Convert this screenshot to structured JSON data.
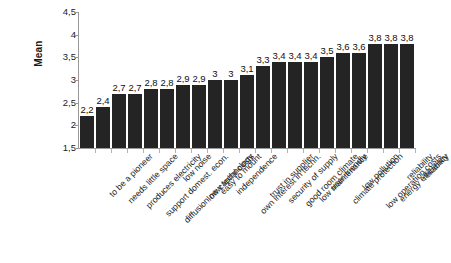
{
  "chart_data": {
    "type": "bar",
    "title": "",
    "subtitle": "",
    "xlabel": "",
    "ylabel": "Mean",
    "ylim": [
      1.5,
      4.5
    ],
    "ytick_labels": [
      "4,5",
      "4",
      "3,5",
      "3",
      "2,5",
      "2",
      "1,5"
    ],
    "ytick_values": [
      4.5,
      4.0,
      3.5,
      3.0,
      2.5,
      2.0,
      1.5
    ],
    "grid": false,
    "legend": "none",
    "decimal_separator": ",",
    "bar_color": "#242424",
    "categories": [
      "to be a pioneer",
      "needs little space",
      "produces electricity",
      "support domest. econ.",
      "diffusion new technology",
      "low noise",
      "low capital costs",
      "easy to mount",
      "independence",
      "own interest in techn.",
      "trust in supplier",
      "security of supply",
      "good room climate",
      "low maintenance",
      "user-friendly",
      "climate protection",
      "low pollution",
      "low operation costs",
      "energy efficiency",
      "reliability",
      "reliability"
    ],
    "values": [
      2.2,
      2.4,
      2.7,
      2.7,
      2.8,
      2.8,
      2.9,
      2.9,
      3.0,
      3.0,
      3.1,
      3.3,
      3.4,
      3.4,
      3.4,
      3.5,
      3.6,
      3.6,
      3.8,
      3.8,
      3.8
    ],
    "value_labels": [
      "2,2",
      "2,4",
      "2,7",
      "2,7",
      "2,8",
      "2,8",
      "2,9",
      "2,9",
      "3",
      "3",
      "3,1",
      "3,3",
      "3,4",
      "3,4",
      "3,4",
      "3,5",
      "3,6",
      "3,6",
      "3,8",
      "3,8",
      "3,8"
    ]
  }
}
